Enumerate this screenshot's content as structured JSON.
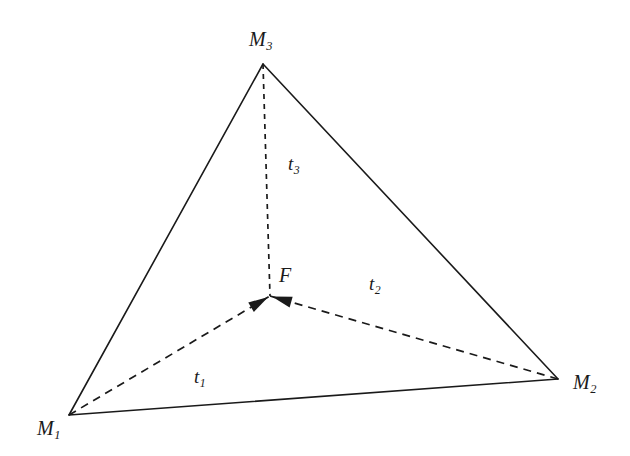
{
  "figure": {
    "background_color": "#ffffff",
    "stroke_color": "#1a1a1a",
    "width": 630,
    "height": 456
  },
  "vertices": {
    "m1": {
      "base": "M",
      "sub": "1",
      "x": 69,
      "y": 415,
      "label_x": 37,
      "label_y": 418
    },
    "m2": {
      "base": "M",
      "sub": "2",
      "x": 558,
      "y": 379,
      "label_x": 573,
      "label_y": 372
    },
    "m3": {
      "base": "M",
      "sub": "3",
      "x": 263,
      "y": 64,
      "label_x": 249,
      "label_y": 29
    }
  },
  "fermat_point": {
    "label": "F",
    "x": 270,
    "y": 296,
    "label_x": 279,
    "label_y": 265
  },
  "segments": [
    {
      "name": "t1",
      "base": "t",
      "sub": "1",
      "from": "m1",
      "to": "F",
      "style": "dashed",
      "arrow": true,
      "label_x": 194,
      "label_y": 367
    },
    {
      "name": "t2",
      "base": "t",
      "sub": "2",
      "from": "m2",
      "to": "F",
      "style": "dashed",
      "arrow": true,
      "label_x": 369,
      "label_y": 274
    },
    {
      "name": "t3",
      "base": "t",
      "sub": "3",
      "from": "m3",
      "to": "F",
      "style": "dashed",
      "arrow": false,
      "label_x": 288,
      "label_y": 154
    }
  ],
  "triangle_edges": [
    {
      "name": "edge-m1-m2",
      "from": "m1",
      "to": "m2",
      "style": "solid"
    },
    {
      "name": "edge-m2-m3",
      "from": "m2",
      "to": "m3",
      "style": "solid"
    },
    {
      "name": "edge-m3-m1",
      "from": "m3",
      "to": "m1",
      "style": "solid"
    }
  ],
  "chart_data": {
    "type": "diagram",
    "points": [
      {
        "id": "M1",
        "label": "M_1",
        "x": 69,
        "y": 415
      },
      {
        "id": "M2",
        "label": "M_2",
        "x": 558,
        "y": 379
      },
      {
        "id": "M3",
        "label": "M_3",
        "x": 263,
        "y": 64
      },
      {
        "id": "F",
        "label": "F",
        "x": 270,
        "y": 296
      }
    ],
    "solid_edges": [
      [
        "M1",
        "M2"
      ],
      [
        "M2",
        "M3"
      ],
      [
        "M3",
        "M1"
      ]
    ],
    "dashed_vectors": [
      {
        "label": "t_1",
        "from": "M1",
        "to": "F",
        "arrowhead_at": "F"
      },
      {
        "label": "t_2",
        "from": "M2",
        "to": "F",
        "arrowhead_at": "F"
      },
      {
        "label": "t_3",
        "from": "M3",
        "to": "F",
        "arrowhead_at": "none"
      }
    ]
  }
}
